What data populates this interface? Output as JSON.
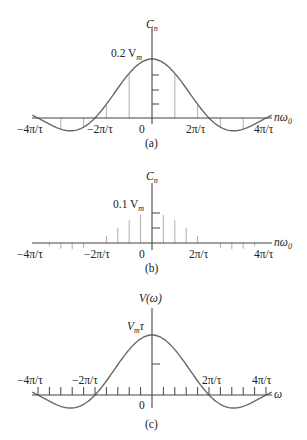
{
  "figure": {
    "panels": [
      {
        "id": "a",
        "caption": "(a)",
        "y_label": "C",
        "y_label_sub": "n",
        "x_label": "nω",
        "x_label_sub": "0",
        "peak_label": "0.2 V",
        "peak_label_sub": "m",
        "x_ticks": [
          "−4π/τ",
          "−2π/τ",
          "0",
          "2π/τ",
          "4π/τ"
        ]
      },
      {
        "id": "b",
        "caption": "(b)",
        "y_label": "C",
        "y_label_sub": "n",
        "x_label": "nω",
        "x_label_sub": "0",
        "peak_label": "0.1 V",
        "peak_label_sub": "m",
        "x_ticks": [
          "−4π/τ",
          "−2π/τ",
          "0",
          "2π/τ",
          "4π/τ"
        ]
      },
      {
        "id": "c",
        "caption": "(c)",
        "y_label": "V(ω)",
        "x_label": "ω",
        "peak_label": "V",
        "peak_label_sub": "m",
        "peak_label_suffix": "τ",
        "x_ticks": [
          "−4π/τ",
          "−2π/τ",
          "0",
          "2π/τ",
          "4π/τ"
        ]
      }
    ]
  },
  "chart_data": [
    {
      "type": "line",
      "title": "(a)",
      "description": "Line spectrum of Fourier coefficients C_n with sinc envelope; peak 0.2 V_m at n·ω0 = 0; zeros at ±2π/τ, ±4π/τ",
      "xlabel": "nω0",
      "ylabel": "Cn",
      "x_tick_labels": [
        "−4π/τ",
        "−2π/τ",
        "0",
        "2π/τ",
        "4π/τ"
      ],
      "peak": "0.2 Vm",
      "envelope": "sinc",
      "stem_spacing": "π/(2.5τ)",
      "zeros": [
        "−4π/τ",
        "−2π/τ",
        "2π/τ",
        "4π/τ"
      ]
    },
    {
      "type": "line",
      "title": "(b)",
      "description": "Denser line spectrum C_n (period doubled); peak 0.1 V_m at 0; zeros at ±2π/τ, ±4π/τ",
      "xlabel": "nω0",
      "ylabel": "Cn",
      "x_tick_labels": [
        "−4π/τ",
        "−2π/τ",
        "0",
        "2π/τ",
        "4π/τ"
      ],
      "peak": "0.1 Vm",
      "envelope": "sinc"
    },
    {
      "type": "line",
      "title": "(c)",
      "description": "Continuous Fourier transform V(ω) = Vm τ sinc; peak Vm τ at ω = 0; zeros at ±2π/τ, ±4π/τ",
      "xlabel": "ω",
      "ylabel": "V(ω)",
      "x_tick_labels": [
        "−4π/τ",
        "−2π/τ",
        "0",
        "2π/τ",
        "4π/τ"
      ],
      "peak": "Vm τ",
      "envelope": "sinc"
    }
  ]
}
